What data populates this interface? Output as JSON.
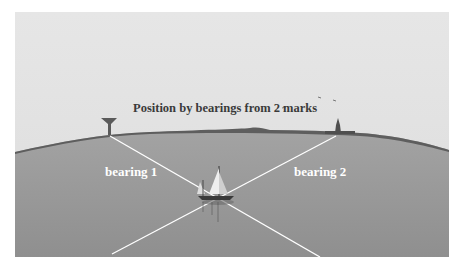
{
  "figure": {
    "title": "Position by bearings from 2 marks",
    "labels": {
      "bearing_1": "bearing 1",
      "bearing_2": "bearing 2"
    },
    "marks": [
      {
        "name": "water-tower",
        "x": 118,
        "y": 125
      },
      {
        "name": "church-spire",
        "x": 338,
        "y": 128
      }
    ],
    "boat_position": {
      "x": 218,
      "y": 198
    },
    "colors": {
      "sky": "#e3e3e3",
      "sea": "#9c9c9c",
      "land": "#5e5e5e",
      "bearing_line": "#ffffff",
      "title_text": "#3a3a3a",
      "label_text": "#ffffff"
    }
  }
}
